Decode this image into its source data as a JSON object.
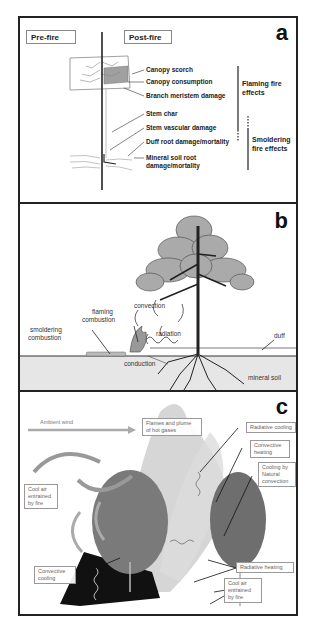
{
  "figure": {
    "panels": [
      {
        "id": "a",
        "letter": "a",
        "headers": {
          "pre_fire": "Pre-fire",
          "post_fire": "Post-fire"
        },
        "damage_labels": [
          "Canopy scorch",
          "Canopy consumption",
          "Branch meristem damage",
          "Stem char",
          "Stem vascular damage",
          "Duff root damage/mortality",
          "Mineral soil root",
          "damage/mortality"
        ],
        "effect_groups": {
          "flaming": [
            "Flaming fire",
            "effects"
          ],
          "smoldering": [
            "Smoldering",
            "fire effects"
          ]
        }
      },
      {
        "id": "b",
        "letter": "b",
        "labels": {
          "convection": "convection",
          "flaming_1": "flaming",
          "flaming_2": "combustion",
          "smoldering_1": "smoldering",
          "smoldering_2": "combustion",
          "radiation": "radiation",
          "conduction": "conduction",
          "duff": "duff",
          "mineral_soil": "mineral soil"
        }
      },
      {
        "id": "c",
        "letter": "c",
        "labels": {
          "ambient_wind": "Ambient wind",
          "flames_plume": [
            "Flames and plume",
            "of hot gases"
          ],
          "radiative_cooling": "Radiative cooling",
          "convective_heating": [
            "Convective",
            "heating"
          ],
          "cooling_natural": [
            "Cooling by",
            "Natural",
            "convection"
          ],
          "cool_air_left": [
            "Cool air",
            "entrained",
            "by fire"
          ],
          "convective_cooling": [
            "Convective",
            "cooling"
          ],
          "radiative_heating": "Radiative heating",
          "cool_air_right": [
            "Cool air",
            "entrained",
            "by fire"
          ]
        }
      }
    ]
  },
  "colors": {
    "border": "#222222",
    "foliage_gray": "#a8a8a8",
    "scorch_gray": "#9a9a9a",
    "soil_gray": "#e6e6e6",
    "plume_gray": "#c8c8c8",
    "tree_dark": "#6a6a6a",
    "burnt_black": "#111111"
  }
}
